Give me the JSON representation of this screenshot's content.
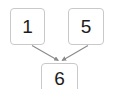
{
  "diagram": {
    "type": "flow-diagram",
    "background_color": "#ffffff",
    "node_border_color": "#c9c9c9",
    "node_fill_color": "#ffffff",
    "edge_color": "#8a8a8a",
    "text_color": "#1c1c1c",
    "nodes": [
      {
        "id": "one",
        "label": "1",
        "x": 10,
        "y": 8,
        "width": 35,
        "height": 37
      },
      {
        "id": "five",
        "label": "5",
        "x": 68,
        "y": 8,
        "width": 36,
        "height": 37
      },
      {
        "id": "six",
        "label": "6",
        "x": 41,
        "y": 63,
        "width": 37,
        "height": 30
      }
    ],
    "edges": [
      {
        "id": "one-to-six",
        "from": "one",
        "to": "six",
        "arrowhead": true
      },
      {
        "id": "five-to-six",
        "from": "five",
        "to": "six",
        "arrowhead": true
      }
    ]
  }
}
